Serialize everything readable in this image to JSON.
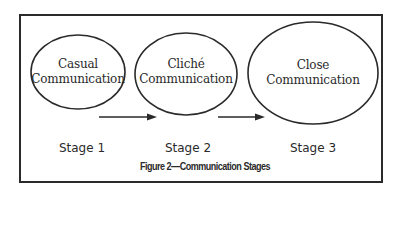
{
  "diagram": {
    "caption": "Figure 2—Communication Stages",
    "stages": [
      {
        "node_line1": "Casual",
        "node_line2": "Communication",
        "label": "Stage 1"
      },
      {
        "node_line1": "Cliché",
        "node_line2": "Communication",
        "label": "Stage 2"
      },
      {
        "node_line1": "Close",
        "node_line2": "Communication",
        "label": "Stage 3"
      }
    ],
    "edges": [
      {
        "from": "Stage 1",
        "to": "Stage 2",
        "type": "arrow"
      },
      {
        "from": "Stage 2",
        "to": "Stage 3",
        "type": "arrow"
      }
    ],
    "colors": {
      "stroke": "#2a2a2a",
      "background": "#ffffff"
    }
  }
}
